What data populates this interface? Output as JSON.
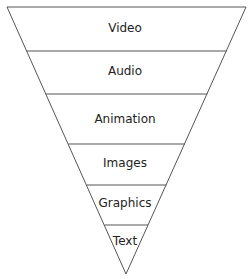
{
  "diagram": {
    "type": "inverted-pyramid",
    "layers": [
      {
        "label": "Video"
      },
      {
        "label": "Audio"
      },
      {
        "label": "Animation"
      },
      {
        "label": "Images"
      },
      {
        "label": "Graphics"
      },
      {
        "label": "Text"
      }
    ],
    "colors": {
      "stroke": "#555555",
      "fill": "#ffffff",
      "text": "#222222"
    }
  }
}
